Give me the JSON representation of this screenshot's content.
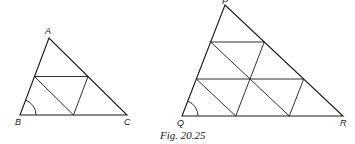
{
  "figure": {
    "caption": "Fig. 20.25",
    "triangle_small": {
      "labels": {
        "A": "A",
        "B": "B",
        "C": "C"
      },
      "vertices": {
        "A": [
          49,
          38
        ],
        "B": [
          20,
          115
        ],
        "C": [
          127,
          115
        ]
      },
      "subdivisions": 2,
      "angle_marked": "B"
    },
    "triangle_large": {
      "labels": {
        "P": "P",
        "Q": "Q",
        "R": "R"
      },
      "vertices": {
        "P": [
          225,
          5
        ],
        "Q": [
          182,
          116
        ],
        "R": [
          343,
          116
        ]
      },
      "subdivisions": 3,
      "angle_marked": "Q"
    },
    "line_color": "#1a1a1a"
  }
}
